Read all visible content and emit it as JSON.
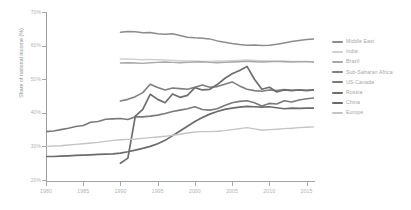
{
  "chart_data": {
    "type": "line",
    "title": "",
    "xlabel": "",
    "ylabel": "Share of national income (%)",
    "xlim": [
      1980,
      2016
    ],
    "ylim": [
      20,
      70
    ],
    "yticks": [
      "70%",
      "60%",
      "50%",
      "40%",
      "30%",
      "20%"
    ],
    "ytick_values": [
      70,
      60,
      50,
      40,
      30,
      20
    ],
    "xticks": [
      "1980",
      "1985",
      "1990",
      "1995",
      "2000",
      "2005",
      "2010",
      "2015"
    ],
    "xtick_values": [
      1980,
      1985,
      1990,
      1995,
      2000,
      2005,
      2010,
      2015
    ],
    "grid": false,
    "legend_position": "right",
    "series": [
      {
        "name": "Middle East",
        "color": "#8c8c8c",
        "width": 1.5,
        "x": [
          1990,
          1991,
          1992,
          1993,
          1994,
          1995,
          1996,
          1997,
          1998,
          1999,
          2000,
          2001,
          2002,
          2003,
          2004,
          2005,
          2006,
          2007,
          2008,
          2009,
          2010,
          2011,
          2012,
          2013,
          2014,
          2015,
          2016
        ],
        "y": [
          64.0,
          64.2,
          64.1,
          63.8,
          63.9,
          63.5,
          63.4,
          63.5,
          63.0,
          62.5,
          62.3,
          62.2,
          62.0,
          61.4,
          61.0,
          60.6,
          60.3,
          60.1,
          60.2,
          60.0,
          60.1,
          60.4,
          60.8,
          61.2,
          61.5,
          61.8,
          62.0
        ]
      },
      {
        "name": "India",
        "color": "#cfcfcf",
        "width": 1.4,
        "x": [
          1990,
          1991,
          1992,
          1993,
          1994,
          1995,
          1996,
          1997,
          1998,
          1999,
          2000,
          2001,
          2002,
          2003,
          2004,
          2005,
          2006,
          2007,
          2008,
          2009,
          2010,
          2011,
          2012,
          2013,
          2014,
          2015,
          2016
        ],
        "y": [
          56.0,
          56.0,
          55.9,
          55.8,
          55.9,
          55.8,
          55.7,
          55.6,
          55.5,
          55.4,
          55.4,
          55.3,
          55.3,
          55.4,
          55.4,
          55.5,
          55.6,
          55.7,
          55.6,
          55.5,
          55.4,
          55.4,
          55.4,
          55.3,
          55.3,
          55.3,
          55.2
        ]
      },
      {
        "name": "Brazil",
        "color": "#a8a8a8",
        "width": 1.4,
        "x": [
          1990,
          1991,
          1992,
          1993,
          1994,
          1995,
          1996,
          1997,
          1998,
          1999,
          2000,
          2001,
          2002,
          2003,
          2004,
          2005,
          2006,
          2007,
          2008,
          2009,
          2010,
          2011,
          2012,
          2013,
          2014,
          2015,
          2016
        ],
        "y": [
          54.8,
          54.9,
          54.8,
          54.7,
          54.9,
          55.0,
          55.1,
          55.0,
          54.9,
          55.0,
          55.1,
          55.2,
          55.0,
          54.9,
          55.0,
          55.1,
          55.2,
          55.3,
          55.2,
          55.1,
          55.2,
          55.3,
          55.2,
          55.1,
          55.2,
          55.2,
          55.1
        ]
      },
      {
        "name": "Sub-Saharan Africa",
        "color": "#7f7f7f",
        "width": 1.6,
        "x": [
          1990,
          1991,
          1992,
          1993,
          1994,
          1995,
          1996,
          1997,
          1998,
          1999,
          2000,
          2001,
          2002,
          2003,
          2004,
          2005,
          2006,
          2007,
          2008,
          2009,
          2010,
          2011,
          2012,
          2013,
          2014,
          2015,
          2016
        ],
        "y": [
          43.5,
          44.0,
          44.8,
          46.0,
          48.5,
          47.5,
          46.8,
          47.4,
          47.2,
          47.0,
          47.6,
          48.3,
          47.6,
          47.8,
          48.5,
          49.2,
          48.0,
          47.0,
          46.6,
          46.4,
          46.8,
          46.6,
          46.9,
          46.7,
          46.8,
          46.7,
          46.8
        ]
      },
      {
        "name": "US-Canada",
        "color": "#7a7a7a",
        "width": 1.6,
        "x": [
          1980,
          1981,
          1982,
          1983,
          1984,
          1985,
          1986,
          1987,
          1988,
          1989,
          1990,
          1991,
          1992,
          1993,
          1994,
          1995,
          1996,
          1997,
          1998,
          1999,
          2000,
          2001,
          2002,
          2003,
          2004,
          2005,
          2006,
          2007,
          2008,
          2009,
          2010,
          2011,
          2012,
          2013,
          2014,
          2015,
          2016
        ],
        "y": [
          34.4,
          34.6,
          35.0,
          35.4,
          35.9,
          36.2,
          37.2,
          37.4,
          38.1,
          38.2,
          38.3,
          38.0,
          38.8,
          38.8,
          39.0,
          39.3,
          39.8,
          40.4,
          40.8,
          41.2,
          41.8,
          41.0,
          40.8,
          41.2,
          42.2,
          43.0,
          43.4,
          43.6,
          43.0,
          42.0,
          42.8,
          42.6,
          43.6,
          43.2,
          43.8,
          44.2,
          44.4
        ]
      },
      {
        "name": "Russia",
        "color": "#6e6e6e",
        "width": 1.7,
        "x": [
          1990,
          1991,
          1992,
          1993,
          1994,
          1995,
          1996,
          1997,
          1998,
          1999,
          2000,
          2001,
          2002,
          2003,
          2004,
          2005,
          2006,
          2007,
          2008,
          2009,
          2010,
          2011,
          2012,
          2013,
          2014,
          2015,
          2016
        ],
        "y": [
          25.0,
          26.5,
          39.0,
          41.0,
          45.5,
          44.0,
          43.0,
          45.6,
          44.6,
          45.2,
          47.5,
          46.8,
          47.0,
          48.4,
          50.2,
          51.6,
          52.6,
          53.8,
          50.0,
          47.0,
          47.6,
          46.2,
          46.8,
          46.6,
          46.8,
          46.6,
          46.8
        ]
      },
      {
        "name": "China",
        "color": "#6b6b6b",
        "width": 1.7,
        "x": [
          1980,
          1981,
          1982,
          1983,
          1984,
          1985,
          1986,
          1987,
          1988,
          1989,
          1990,
          1991,
          1992,
          1993,
          1994,
          1995,
          1996,
          1997,
          1998,
          1999,
          2000,
          2001,
          2002,
          2003,
          2004,
          2005,
          2006,
          2007,
          2008,
          2009,
          2010,
          2011,
          2012,
          2013,
          2014,
          2015,
          2016
        ],
        "y": [
          27.0,
          27.0,
          27.1,
          27.2,
          27.3,
          27.4,
          27.5,
          27.6,
          27.7,
          27.8,
          28.0,
          28.4,
          28.9,
          29.4,
          30.0,
          30.8,
          31.8,
          33.2,
          34.6,
          36.0,
          37.4,
          38.6,
          39.6,
          40.4,
          41.0,
          41.4,
          41.7,
          41.9,
          41.8,
          41.7,
          41.8,
          41.5,
          41.2,
          41.4,
          41.3,
          41.4,
          41.4
        ]
      },
      {
        "name": "Europe",
        "color": "#c4c4c4",
        "width": 1.4,
        "x": [
          1980,
          1981,
          1982,
          1983,
          1984,
          1985,
          1986,
          1987,
          1988,
          1989,
          1990,
          1991,
          1992,
          1993,
          1994,
          1995,
          1996,
          1997,
          1998,
          1999,
          2000,
          2001,
          2002,
          2003,
          2004,
          2005,
          2006,
          2007,
          2008,
          2009,
          2010,
          2011,
          2012,
          2013,
          2014,
          2015,
          2016
        ],
        "y": [
          30.0,
          30.1,
          30.2,
          30.4,
          30.6,
          30.8,
          31.0,
          31.2,
          31.5,
          31.8,
          32.0,
          32.1,
          32.2,
          32.4,
          32.6,
          32.8,
          33.0,
          33.3,
          33.6,
          34.0,
          34.3,
          34.4,
          34.4,
          34.5,
          34.7,
          35.0,
          35.3,
          35.6,
          35.2,
          34.8,
          35.0,
          35.1,
          35.3,
          35.4,
          35.6,
          35.7,
          35.8
        ]
      }
    ]
  },
  "legend": {
    "items": [
      {
        "label": "Middle East",
        "color": "#8c8c8c"
      },
      {
        "label": "India",
        "color": "#cfcfcf"
      },
      {
        "label": "Brazil",
        "color": "#a8a8a8"
      },
      {
        "label": "Sub-Saharan Africa",
        "color": "#7f7f7f"
      },
      {
        "label": "US-Canada",
        "color": "#7a7a7a"
      },
      {
        "label": "Russia",
        "color": "#6e6e6e"
      },
      {
        "label": "China",
        "color": "#6b6b6b"
      },
      {
        "label": "Europe",
        "color": "#c4c4c4"
      }
    ]
  }
}
